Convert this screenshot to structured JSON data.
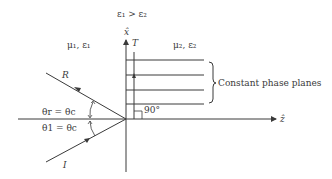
{
  "diagram": {
    "condition": "ε₁ > ε₂",
    "axis_x_label": "x̂",
    "axis_z_label": "ẑ",
    "transmitted_label": "T",
    "reflected_label": "R",
    "incident_label": "I",
    "medium1": "μ₁, ε₁",
    "medium2": "μ₂, ε₂",
    "reflected_angle": "θr = θc",
    "incident_angle": "θ1 = θc",
    "right_angle": "90°",
    "phase_planes_label": "Constant phase planes",
    "stroke_color": "#3a3a3a"
  }
}
